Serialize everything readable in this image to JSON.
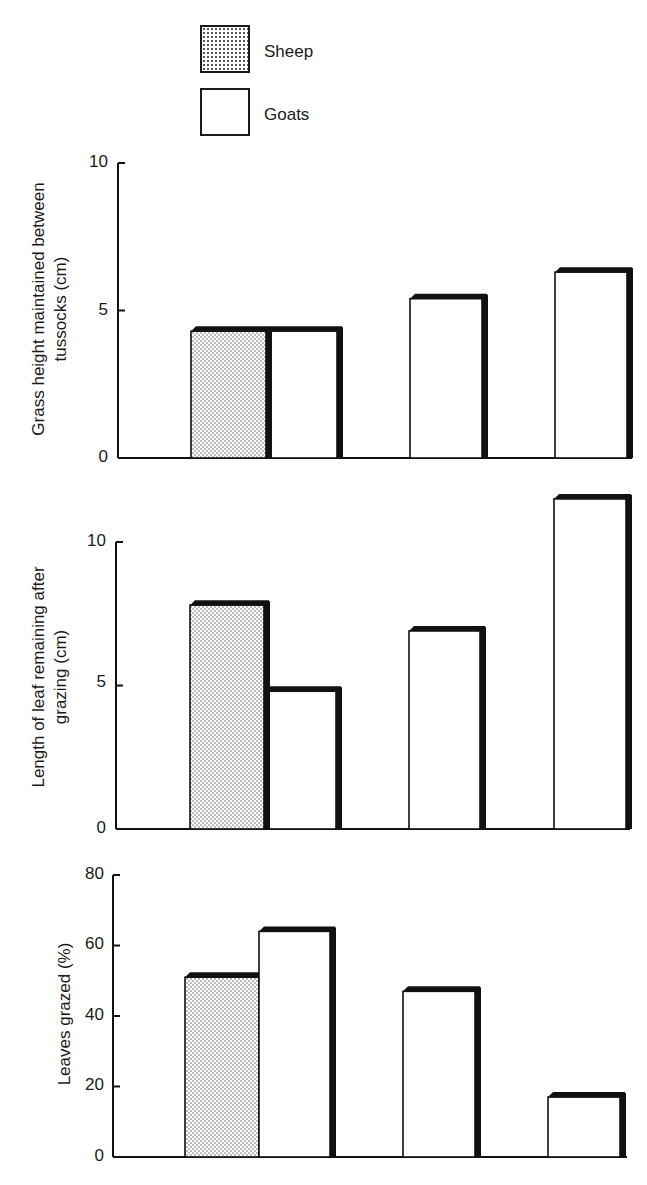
{
  "legend": {
    "items": [
      {
        "label": "Sheep",
        "fill": "dotted"
      },
      {
        "label": "Goats",
        "fill": "white"
      }
    ]
  },
  "charts": [
    {
      "ylabel_line1": "Grass height maintained between",
      "ylabel_line2": "tussocks (cm)",
      "ticks": [
        "0",
        "5",
        "10"
      ]
    },
    {
      "ylabel_line1": "Length of leaf remaining after",
      "ylabel_line2": "grazing (cm)",
      "ticks": [
        "0",
        "5",
        "10"
      ]
    },
    {
      "ylabel_line1": "Leaves grazed (%)",
      "ylabel_line2": "",
      "ticks": [
        "0",
        "20",
        "40",
        "60",
        "80"
      ]
    }
  ],
  "chart_data": [
    {
      "type": "bar",
      "title": "",
      "xlabel": "",
      "ylabel": "Grass height maintained between tussocks (cm)",
      "ylim": [
        0,
        10
      ],
      "yticks": [
        0,
        5,
        10
      ],
      "grid": false,
      "legend_position": "top",
      "categories": [
        "Group 1",
        "Group 2",
        "Group 3"
      ],
      "series": [
        {
          "name": "Sheep",
          "values": [
            4.3,
            null,
            null
          ]
        },
        {
          "name": "Goats",
          "values": [
            4.3,
            5.4,
            6.3
          ]
        }
      ]
    },
    {
      "type": "bar",
      "title": "",
      "xlabel": "",
      "ylabel": "Length of leaf remaining after grazing (cm)",
      "ylim": [
        0,
        12
      ],
      "yticks": [
        0,
        5,
        10
      ],
      "grid": false,
      "categories": [
        "Group 1",
        "Group 2",
        "Group 3"
      ],
      "series": [
        {
          "name": "Sheep",
          "values": [
            7.8,
            null,
            null
          ]
        },
        {
          "name": "Goats",
          "values": [
            4.8,
            6.9,
            11.5
          ]
        }
      ]
    },
    {
      "type": "bar",
      "title": "",
      "xlabel": "",
      "ylabel": "Leaves grazed (%)",
      "ylim": [
        0,
        80
      ],
      "yticks": [
        0,
        20,
        40,
        60,
        80
      ],
      "grid": false,
      "categories": [
        "Group 1",
        "Group 2",
        "Group 3"
      ],
      "series": [
        {
          "name": "Sheep",
          "values": [
            51,
            null,
            null
          ]
        },
        {
          "name": "Goats",
          "values": [
            64,
            47,
            17
          ]
        }
      ]
    }
  ]
}
